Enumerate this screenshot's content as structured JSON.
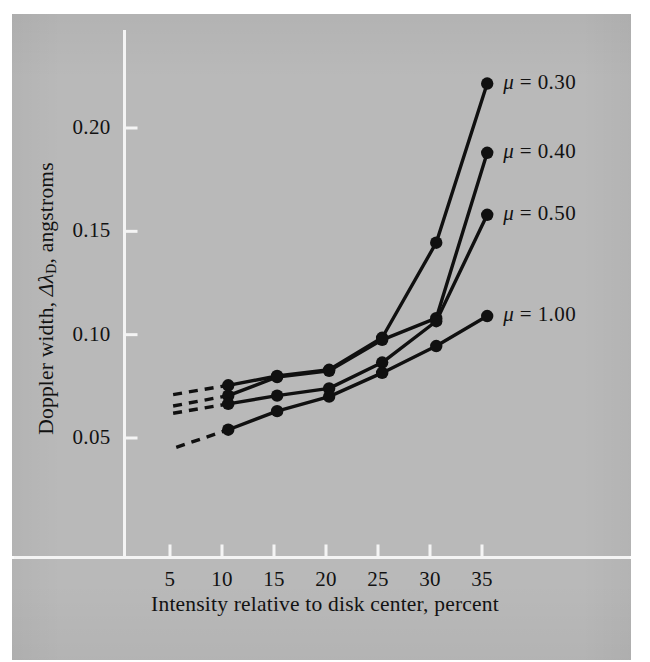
{
  "figure": {
    "background_color": "#b9b9b9",
    "page_color": "#ffffff",
    "ink_color": "#101010",
    "axis_color": "#f4f4f4"
  },
  "axis_titles": {
    "x": "Intensity relative to disk center, percent",
    "y_prefix": "Doppler width, ",
    "y_symbol": "Δλ",
    "y_subscript": "D",
    "y_suffix": ", angstroms"
  },
  "labels": {
    "mu_030": "μ = 0.30",
    "mu_040": "μ = 0.40",
    "mu_050": "μ = 0.50",
    "mu_100": "μ = 1.00"
  },
  "chart_data": {
    "type": "line",
    "title": "",
    "xlabel": "Intensity relative to disk center, percent",
    "ylabel": "Doppler width, ΔλD, angstroms",
    "xlim": [
      2.5,
      38.0
    ],
    "ylim": [
      0.035,
      0.235
    ],
    "xticks": [
      5,
      10,
      15,
      20,
      25,
      30,
      35
    ],
    "xticklabels": [
      "5",
      "10",
      "15",
      "20",
      "25",
      "30",
      "35"
    ],
    "yticks": [
      0.05,
      0.1,
      0.15,
      0.2
    ],
    "yticklabels": [
      "0.05",
      "0.10",
      "0.15",
      "0.20"
    ],
    "grid": false,
    "legend": "inline-right-endpoint-labels",
    "marker": "filled-circle",
    "series": [
      {
        "name": "μ = 0.30",
        "label": "μ = 0.30",
        "x": [
          10.6,
          15.3,
          20.3,
          25.4,
          30.6,
          35.5
        ],
        "y": [
          0.0755,
          0.08,
          0.083,
          0.0985,
          0.1445,
          0.2215
        ],
        "extrapolation_dashed": {
          "x": [
            5.3,
            10.6
          ],
          "y": [
            0.071,
            0.0755
          ]
        }
      },
      {
        "name": "μ = 0.40",
        "label": "μ = 0.40",
        "x": [
          10.6,
          15.3,
          20.3,
          25.4,
          30.6,
          35.5
        ],
        "y": [
          0.0705,
          0.0795,
          0.0825,
          0.0975,
          0.108,
          0.188
        ],
        "extrapolation_dashed": {
          "x": [
            5.3,
            10.6
          ],
          "y": [
            0.0655,
            0.0705
          ]
        }
      },
      {
        "name": "μ = 0.50",
        "label": "μ = 0.50",
        "x": [
          10.6,
          15.3,
          20.3,
          25.4,
          30.6,
          35.5
        ],
        "y": [
          0.0665,
          0.0705,
          0.074,
          0.0865,
          0.1065,
          0.158
        ],
        "extrapolation_dashed": {
          "x": [
            5.3,
            10.6
          ],
          "y": [
            0.062,
            0.0665
          ]
        }
      },
      {
        "name": "μ = 1.00",
        "label": "μ = 1.00",
        "x": [
          10.6,
          15.3,
          20.3,
          25.4,
          30.6,
          35.5
        ],
        "y": [
          0.054,
          0.063,
          0.07,
          0.0815,
          0.0945,
          0.109
        ],
        "extrapolation_dashed": {
          "x": [
            5.6,
            10.6
          ],
          "y": [
            0.0455,
            0.054
          ]
        }
      }
    ]
  }
}
